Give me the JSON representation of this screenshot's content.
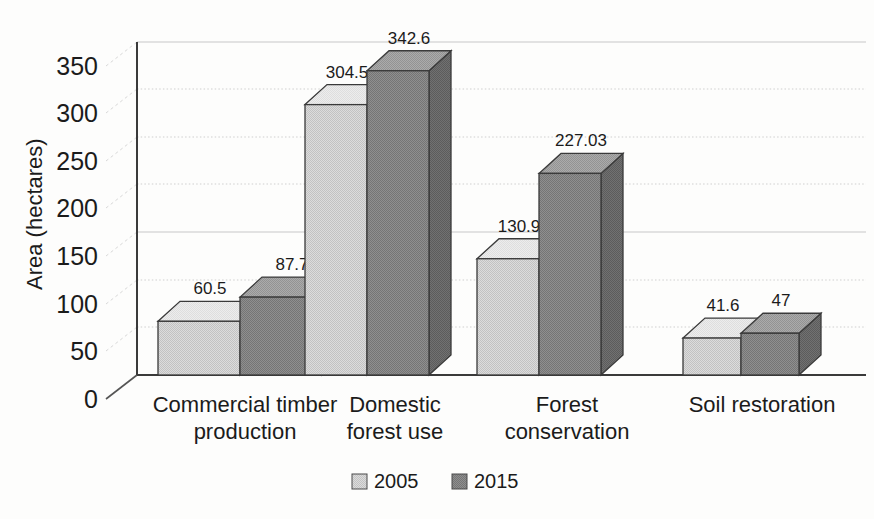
{
  "chart_data": {
    "type": "bar",
    "title": "",
    "subtitle": "",
    "xlabel": "",
    "ylabel": "Area (hectares)",
    "ylim": [
      0,
      375
    ],
    "yticks": [
      0,
      50,
      100,
      150,
      200,
      250,
      300,
      350
    ],
    "ytick_labels": [
      "0",
      "50",
      "100",
      "150",
      "200",
      "250",
      "300",
      "350"
    ],
    "grid": true,
    "grid_axis": "y",
    "legend_position": "bottom",
    "projection": "3d-bar",
    "categories": [
      "Commercial timber production",
      "Domestic forest use",
      "Forest conservation",
      "Soil restoration"
    ],
    "category_lines": [
      [
        "Commercial timber",
        "production"
      ],
      [
        "Domestic",
        "forest use"
      ],
      [
        "Forest",
        "conservation"
      ],
      [
        "Soil restoration"
      ]
    ],
    "series": [
      {
        "name": "2005",
        "color": "#d2d2d2",
        "top_color": "#eaeaea",
        "side_color": "#b4b4b4",
        "values": [
          60.5,
          304.5,
          130.9,
          41.6
        ],
        "labels": [
          "60.5",
          "304.5",
          "130.9",
          "41.6"
        ]
      },
      {
        "name": "2015",
        "color": "#868686",
        "top_color": "#a8a8a8",
        "side_color": "#6d6d6d",
        "values": [
          87.7,
          342.6,
          227.03,
          47
        ],
        "labels": [
          "87.7",
          "342.6",
          "227.03",
          "47"
        ]
      }
    ]
  },
  "legend": {
    "items": [
      {
        "label": "2005",
        "swatch_color": "#d2d2d2"
      },
      {
        "label": "2015",
        "swatch_color": "#868686"
      }
    ]
  },
  "axes": {
    "y_axis_title": "Area (hectares)",
    "y_tick_0": "0",
    "y_tick_1": "50",
    "y_tick_2": "100",
    "y_tick_3": "150",
    "y_tick_4": "200",
    "y_tick_5": "250",
    "y_tick_6": "300",
    "y_tick_7": "350"
  },
  "colors": {
    "background": "#fdfdfc",
    "axis": "#2a2a2a",
    "grid": "#cfcfcf",
    "text": "#1b1b1b",
    "series_2005": "#d2d2d2",
    "series_2015": "#868686"
  }
}
